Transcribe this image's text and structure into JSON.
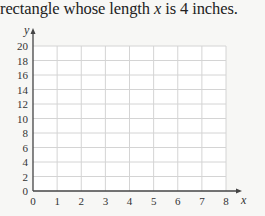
{
  "caption": {
    "before": "rectangle whose length ",
    "var": "x",
    "after": " is 4 inches."
  },
  "chart_data": {
    "type": "line",
    "title": "",
    "xlabel": "x",
    "ylabel": "y",
    "xlim": [
      0,
      8
    ],
    "ylim": [
      0,
      20
    ],
    "x_ticks": [
      0,
      1,
      2,
      3,
      4,
      5,
      6,
      7,
      8
    ],
    "y_ticks": [
      0,
      2,
      4,
      6,
      8,
      10,
      12,
      14,
      16,
      18,
      20
    ],
    "grid": true,
    "series": []
  },
  "colors": {
    "grid": "#d4d4d4",
    "axis": "#444444",
    "plot_bg": "#ffffff"
  }
}
